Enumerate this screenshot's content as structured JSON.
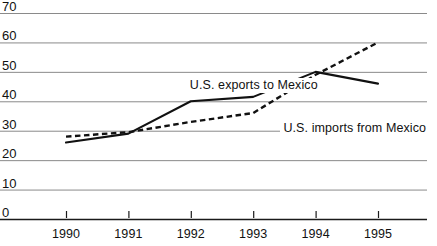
{
  "chart_data": {
    "type": "line",
    "title": "",
    "subtitle": "",
    "xlabel": "",
    "ylabel": "",
    "x": [
      1990,
      1991,
      1992,
      1993,
      1994,
      1995
    ],
    "xtick_labels": [
      "1990",
      "1991",
      "1992",
      "1993",
      "1994",
      "1995"
    ],
    "ytick_labels": [
      "0",
      "10",
      "20",
      "30",
      "40",
      "50",
      "60",
      "70"
    ],
    "yticks": [
      0,
      10,
      20,
      30,
      40,
      50,
      60,
      70
    ],
    "ylim": [
      0,
      70
    ],
    "xlim": [
      1990,
      1995
    ],
    "grid": "horizontal",
    "legend_position": "inline-annotation",
    "series": [
      {
        "name": "U.S. exports to Mexico",
        "style": "solid",
        "color": "#111111",
        "values": [
          26,
          29,
          40,
          41.5,
          50,
          46
        ]
      },
      {
        "name": "U.S. imports from Mexico",
        "style": "dashed",
        "color": "#111111",
        "values": [
          28,
          29.5,
          33,
          36,
          49,
          60
        ]
      }
    ],
    "annotations": [
      {
        "text": "U.S. exports to Mexico",
        "x": 1992.0,
        "y": 45.5
      },
      {
        "text": "U.S. imports from Mexico",
        "x": 1993.5,
        "y": 31.0
      }
    ]
  },
  "axis": {
    "y_labels": [
      "70",
      "60",
      "50",
      "40",
      "30",
      "20",
      "10",
      "0"
    ],
    "x_labels": [
      "1990",
      "1991",
      "1992",
      "1993",
      "1994",
      "1995"
    ]
  },
  "colors": {
    "gridline": "#8a8a8a",
    "axis": "#1a1a1a",
    "series_exports": "#111111",
    "series_imports": "#111111",
    "background": "#ffffff"
  }
}
